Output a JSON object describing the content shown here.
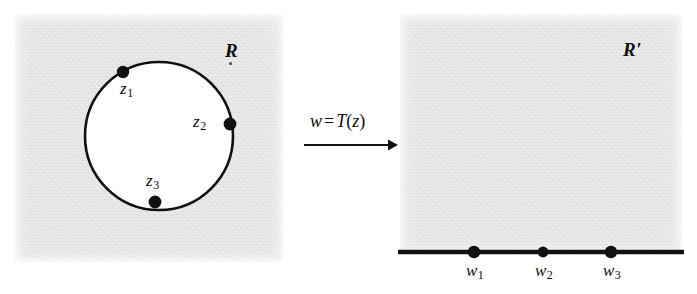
{
  "figure": {
    "type": "complex-mapping-diagram"
  },
  "left_panel": {
    "region_label": "R",
    "shape": "circle",
    "points": [
      {
        "id": "z1",
        "base": "z",
        "sub": "1",
        "label": "z₁"
      },
      {
        "id": "z2",
        "base": "z",
        "sub": "2",
        "label": "z₂"
      },
      {
        "id": "z3",
        "base": "z",
        "sub": "3",
        "label": "z₃"
      }
    ]
  },
  "mapping": {
    "lhs": "w",
    "operator": "=",
    "function": "T",
    "argument": "z",
    "open_paren": "(",
    "close_paren": ")",
    "full_label": "w = T(z)",
    "arrow_direction": "right"
  },
  "right_panel": {
    "region_label": "R′",
    "shape": "half-plane-with-real-axis",
    "points": [
      {
        "id": "w1",
        "base": "w",
        "sub": "1",
        "label": "w₁"
      },
      {
        "id": "w2",
        "base": "w",
        "sub": "2",
        "label": "w₂"
      },
      {
        "id": "w3",
        "base": "w",
        "sub": "3",
        "label": "w₃"
      }
    ]
  },
  "colors": {
    "region_gray": "#dcdcdc",
    "ink": "#111111",
    "page": "#ffffff"
  }
}
